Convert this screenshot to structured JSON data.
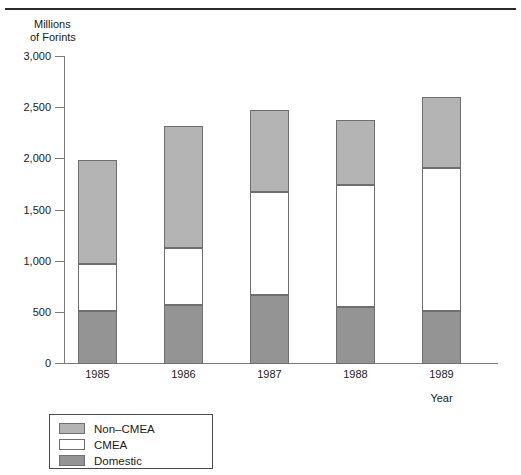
{
  "figure": {
    "y_axis_caption_line1": "Millions",
    "y_axis_caption_line2": "of Forints",
    "x_axis_caption": "Year"
  },
  "chart_data": {
    "type": "bar",
    "stacked": true,
    "title": "",
    "subtitle": "",
    "xlabel": "Year",
    "ylabel": "Millions of Forints",
    "ylim": [
      0,
      3000
    ],
    "yticks": [
      0,
      500,
      1000,
      1500,
      2000,
      2500,
      3000
    ],
    "ytick_labels": [
      "0",
      "500",
      "1,000",
      "1,500",
      "2,000",
      "2,500",
      "3,000"
    ],
    "grid": false,
    "legend_position": "below-left",
    "categories": [
      "1985",
      "1986",
      "1987",
      "1988",
      "1989"
    ],
    "series": [
      {
        "name": "Domestic",
        "color": "#949494",
        "values": [
          515,
          580,
          670,
          560,
          520
        ]
      },
      {
        "name": "CMEA",
        "color": "#ffffff",
        "values": [
          465,
          550,
          1010,
          1190,
          1400
        ]
      },
      {
        "name": "Non–CMEA",
        "color": "#b4b4b4",
        "values": [
          1015,
          1195,
          800,
          630,
          690
        ]
      }
    ],
    "totals": [
      1995,
      2325,
      2480,
      2380,
      2610
    ],
    "cumulative": [
      {
        "category": "1985",
        "domestic_top": 515,
        "cmea_top": 980,
        "noncmea_top": 1995
      },
      {
        "category": "1986",
        "domestic_top": 580,
        "cmea_top": 1130,
        "noncmea_top": 2325
      },
      {
        "category": "1987",
        "domestic_top": 670,
        "cmea_top": 1680,
        "noncmea_top": 2480
      },
      {
        "category": "1988",
        "domestic_top": 560,
        "cmea_top": 1750,
        "noncmea_top": 2380
      },
      {
        "category": "1989",
        "domestic_top": 520,
        "cmea_top": 1920,
        "noncmea_top": 2610
      }
    ],
    "legend": [
      {
        "label": "Non–CMEA",
        "color": "#b4b4b4"
      },
      {
        "label": "CMEA",
        "color": "#ffffff"
      },
      {
        "label": "Domestic",
        "color": "#949494"
      }
    ]
  }
}
